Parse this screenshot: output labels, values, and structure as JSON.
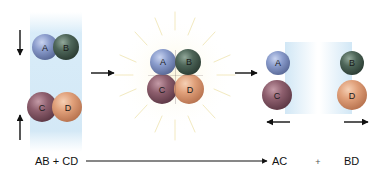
{
  "figure": {
    "stages": [
      {
        "id": "reactants",
        "molecules": [
          {
            "name": "AB",
            "atoms": [
              {
                "label": "A",
                "color": "#8a9ccc"
              },
              {
                "label": "B",
                "color": "#4e6659"
              }
            ]
          },
          {
            "name": "CD",
            "atoms": [
              {
                "label": "C",
                "color": "#8e5f6e"
              },
              {
                "label": "D",
                "color": "#e0a07a"
              }
            ]
          }
        ],
        "motion": [
          "down",
          "up"
        ]
      },
      {
        "id": "intermediate",
        "atoms": [
          {
            "label": "A",
            "color": "#8a9ccc"
          },
          {
            "label": "B",
            "color": "#4e6659"
          },
          {
            "label": "C",
            "color": "#8e5f6e"
          },
          {
            "label": "D",
            "color": "#e0a07a"
          }
        ]
      },
      {
        "id": "products",
        "molecules": [
          {
            "name": "AC",
            "atoms": [
              {
                "label": "A",
                "color": "#8a9ccc"
              },
              {
                "label": "C",
                "color": "#8e5f6e"
              }
            ]
          },
          {
            "name": "BD",
            "atoms": [
              {
                "label": "B",
                "color": "#4e6659"
              },
              {
                "label": "D",
                "color": "#e0a07a"
              }
            ]
          }
        ],
        "motion": [
          "left",
          "right"
        ]
      }
    ],
    "labels": {
      "A": "A",
      "B": "B",
      "C": "C",
      "D": "D"
    },
    "equation": {
      "reactants": "AB + CD",
      "product1": "AC",
      "plus": "+",
      "product2": "BD"
    },
    "colors": {
      "A": "#8a9ccc",
      "B": "#4e6659",
      "C": "#8e5f6e",
      "D": "#e0a07a",
      "band": "#cfe6f5",
      "burst": "#f3ecc4",
      "arrow": "#111111"
    }
  }
}
